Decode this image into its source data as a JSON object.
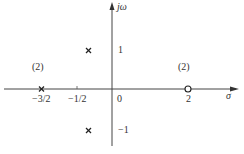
{
  "axes": {
    "x_label": "σ",
    "y_label": "jω"
  },
  "ticks": {
    "x": [
      {
        "label": "−3/2",
        "value": -1.5
      },
      {
        "label": "−1/2",
        "value": -0.5
      },
      {
        "label": "0",
        "value": 0
      },
      {
        "label": "2",
        "value": 2
      }
    ],
    "y": [
      {
        "label": "1",
        "value": 1
      },
      {
        "label": "−1",
        "value": -1
      }
    ]
  },
  "poles": [
    {
      "re": -1.5,
      "im": 0,
      "multiplicity": 2,
      "multiplicity_label": "(2)"
    },
    {
      "re": -0.75,
      "im": 1,
      "multiplicity": 1
    },
    {
      "re": -0.75,
      "im": -1,
      "multiplicity": 1
    }
  ],
  "zeros": [
    {
      "re": 2,
      "im": 0,
      "multiplicity": 2,
      "multiplicity_label": "(2)"
    }
  ]
}
